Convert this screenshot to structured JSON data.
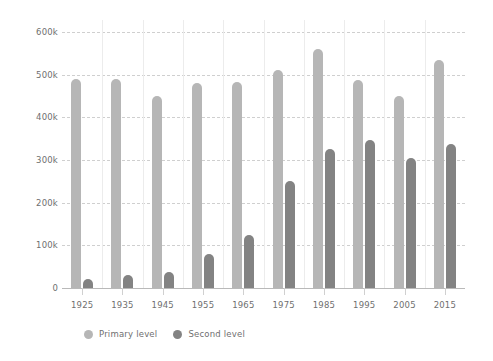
{
  "chart_data": {
    "type": "bar",
    "title": "",
    "subtitle": "",
    "xlabel": "",
    "ylabel": "",
    "categories": [
      "1925",
      "1935",
      "1945",
      "1955",
      "1965",
      "1975",
      "1985",
      "1995",
      "2005",
      "2015"
    ],
    "series": [
      {
        "name": "Primary level",
        "color": "#b6b6b6",
        "values": [
          490000,
          490000,
          450000,
          480000,
          483000,
          512000,
          560000,
          488000,
          450000,
          535000
        ]
      },
      {
        "name": "Second level",
        "color": "#838383",
        "values": [
          20000,
          30000,
          38000,
          80000,
          125000,
          250000,
          325000,
          348000,
          305000,
          338000
        ]
      }
    ],
    "ylim": [
      0,
      600000
    ],
    "ytick_labels": [
      "600k",
      "500k",
      "400k",
      "300k",
      "200k",
      "100k",
      "0"
    ],
    "ytick_values": [
      600000,
      500000,
      400000,
      300000,
      200000,
      100000,
      0
    ],
    "grid": "horizontal-dashed",
    "legend_position": "bottom-left",
    "legend": [
      "Primary level",
      "Second level"
    ]
  }
}
